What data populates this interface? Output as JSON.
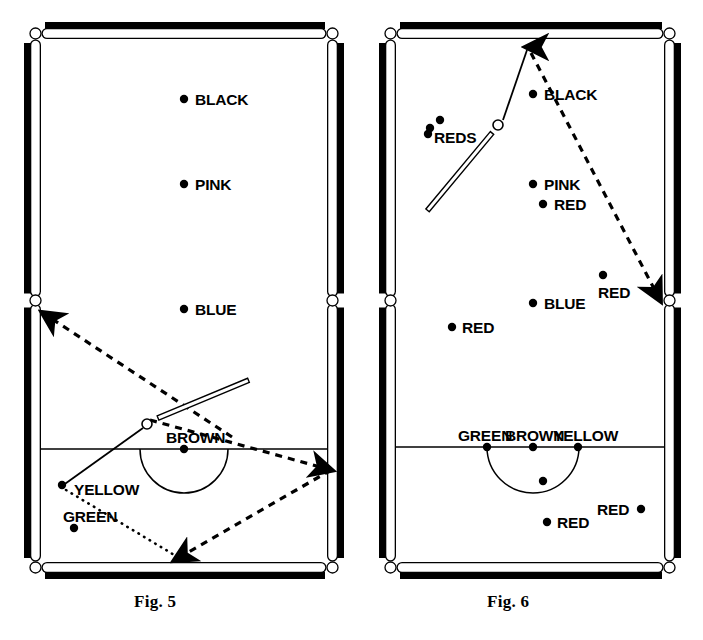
{
  "page": {
    "kind": "snooker-table-diagrams",
    "background": "#ffffff",
    "ink": "#000000",
    "width": 703,
    "height": 640
  },
  "figures": [
    {
      "id": "fig5",
      "caption": "Fig. 5",
      "frame": {
        "x": 30,
        "y": 28,
        "w": 308,
        "h": 545
      },
      "baulk_line_y": 449,
      "d_arc": {
        "cx": 184,
        "cy": 449,
        "r": 44
      },
      "balls": [
        {
          "name": "black-spot",
          "label": "BLACK",
          "x": 184,
          "y": 99,
          "label_x": 195,
          "label_y": 99,
          "label_anchor": "start"
        },
        {
          "name": "pink-spot",
          "label": "PINK",
          "x": 184,
          "y": 184,
          "label_x": 195,
          "label_y": 184,
          "label_anchor": "start"
        },
        {
          "name": "blue-spot",
          "label": "BLUE",
          "x": 184,
          "y": 309,
          "label_x": 195,
          "label_y": 309,
          "label_anchor": "start"
        },
        {
          "name": "brown-spot",
          "label": "BROWN",
          "x": 184,
          "y": 449,
          "label_x": 166,
          "label_y": 437,
          "label_anchor": "start"
        },
        {
          "name": "yellow-spot",
          "label": "YELLOW",
          "x": 62,
          "y": 485,
          "label_x": 74,
          "label_y": 489,
          "label_anchor": "start"
        },
        {
          "name": "green-spot",
          "label": "GREEN",
          "x": 74,
          "y": 528,
          "label_x": 63,
          "label_y": 516,
          "label_anchor": "start"
        }
      ],
      "cue_ball": {
        "x": 147,
        "y": 424,
        "r": 5
      },
      "cue_stick": {
        "x1": 158,
        "y1": 418,
        "x2": 206,
        "y2": 398
      },
      "aim_line": {
        "x1": 143,
        "y1": 428,
        "x2": 62,
        "y2": 486
      },
      "trajectories": [
        {
          "name": "cue-path-to-middle-pocket",
          "style": "dashed",
          "arrow_at": "end",
          "points": [
            [
              232,
              437
            ],
            [
              43,
              313
            ]
          ]
        },
        {
          "name": "object-ball-path-rhombus",
          "style": "dashed",
          "arrow_at": "end",
          "points": [
            [
              150,
              420
            ],
            [
              331,
              470
            ]
          ]
        },
        {
          "name": "rebound-path",
          "style": "dashed",
          "arrow_at": "end",
          "points": [
            [
              331,
              470
            ],
            [
              175,
              560
            ]
          ]
        },
        {
          "name": "yellow-return-path",
          "style": "dotted",
          "arrow_at": "none",
          "points": [
            [
              66,
              490
            ],
            [
              186,
              562
            ]
          ]
        }
      ]
    },
    {
      "id": "fig6",
      "caption": "Fig. 6",
      "frame": {
        "x": 385,
        "y": 28,
        "w": 290,
        "h": 545
      },
      "baulk_line_y": 447,
      "d_arc": {
        "cx": 533,
        "cy": 447,
        "r": 46
      },
      "balls": [
        {
          "name": "black-spot",
          "label": "BLACK",
          "x": 533,
          "y": 94,
          "label_x": 544,
          "label_y": 94,
          "label_anchor": "start"
        },
        {
          "name": "red-cluster-1",
          "label": "",
          "x": 440,
          "y": 120,
          "label_x": 0,
          "label_y": 0,
          "label_anchor": "start"
        },
        {
          "name": "red-cluster-2",
          "label": "",
          "x": 430,
          "y": 128,
          "label_x": 0,
          "label_y": 0,
          "label_anchor": "start"
        },
        {
          "name": "red-cluster-3",
          "label": "REDS",
          "x": 428,
          "y": 134,
          "label_x": 434,
          "label_y": 137,
          "label_anchor": "start"
        },
        {
          "name": "pink-spot",
          "label": "PINK",
          "x": 533,
          "y": 184,
          "label_x": 544,
          "label_y": 184,
          "label_anchor": "start"
        },
        {
          "name": "red-near-pink",
          "label": "RED",
          "x": 543,
          "y": 204,
          "label_x": 554,
          "label_y": 204,
          "label_anchor": "start"
        },
        {
          "name": "red-right",
          "label": "RED",
          "x": 603,
          "y": 275,
          "label_x": 598,
          "label_y": 292,
          "label_anchor": "start"
        },
        {
          "name": "blue-spot",
          "label": "BLUE",
          "x": 533,
          "y": 303,
          "label_x": 544,
          "label_y": 303,
          "label_anchor": "start"
        },
        {
          "name": "red-left",
          "label": "RED",
          "x": 452,
          "y": 327,
          "label_x": 462,
          "label_y": 327,
          "label_anchor": "start"
        },
        {
          "name": "green-spot",
          "label": "GREEN",
          "x": 487,
          "y": 447,
          "label_x": 458,
          "label_y": 435,
          "label_anchor": "start"
        },
        {
          "name": "brown-spot",
          "label": "BROWN",
          "x": 533,
          "y": 447,
          "label_x": 505,
          "label_y": 435,
          "label_anchor": "start"
        },
        {
          "name": "yellow-spot",
          "label": "YELLOW",
          "x": 578,
          "y": 447,
          "label_x": 553,
          "label_y": 435,
          "label_anchor": "start"
        },
        {
          "name": "ball-in-d",
          "label": "",
          "x": 543,
          "y": 481,
          "label_x": 0,
          "label_y": 0,
          "label_anchor": "start"
        },
        {
          "name": "red-bottom",
          "label": "RED",
          "x": 547,
          "y": 522,
          "label_x": 557,
          "label_y": 522,
          "label_anchor": "start"
        },
        {
          "name": "red-bottom-right",
          "label": "RED",
          "x": 641,
          "y": 509,
          "label_x": 597,
          "label_y": 509,
          "label_anchor": "start"
        }
      ],
      "cue_ball": {
        "x": 498,
        "y": 125,
        "r": 5
      },
      "cue_stick": {
        "x1": 492,
        "y1": 133,
        "x2": 457,
        "y2": 175
      },
      "aim_line": {
        "x1": 503,
        "y1": 120,
        "x2": 527,
        "y2": 50
      },
      "trajectories": [
        {
          "name": "cue-path-to-top-cushion",
          "style": "dashed",
          "arrow_at": "start",
          "points": [
            [
              527,
              47
            ],
            [
              527,
              47
            ]
          ]
        },
        {
          "name": "rebound-to-middle-pocket",
          "style": "dashed",
          "arrow_at": "end",
          "points": [
            [
              531,
              53
            ],
            [
              660,
              300
            ]
          ]
        }
      ]
    }
  ]
}
